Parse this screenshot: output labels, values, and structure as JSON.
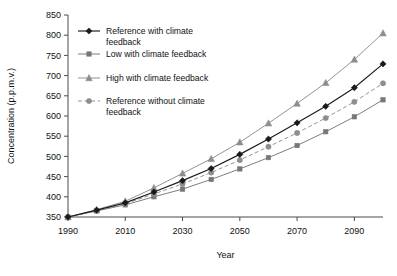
{
  "chart_data": {
    "type": "line",
    "title": "",
    "xlabel": "Year",
    "ylabel": "Concentration (p.p.m.v.)",
    "xlim": [
      1990,
      2100
    ],
    "ylim": [
      350,
      850
    ],
    "ytick_step": 50,
    "xtick_step": 20,
    "grid": false,
    "legend_position": "top-left",
    "xticks": [
      "1990",
      "2010",
      "2030",
      "2050",
      "2070",
      "2090"
    ],
    "xtick_values": [
      1990,
      2010,
      2030,
      2050,
      2070,
      2090
    ],
    "yticks": [
      "350",
      "400",
      "450",
      "500",
      "550",
      "600",
      "650",
      "700",
      "750",
      "800",
      "850"
    ],
    "ytick_values": [
      350,
      400,
      450,
      500,
      550,
      600,
      650,
      700,
      750,
      800,
      850
    ],
    "x": [
      1990,
      2000,
      2010,
      2020,
      2030,
      2040,
      2050,
      2060,
      2070,
      2080,
      2090,
      2100
    ],
    "series": [
      {
        "name": "Reference with climate feedback",
        "marker": "diamond",
        "color": "#1a1a1a",
        "linestyle": "solid",
        "values": [
          350,
          367,
          385,
          412,
          440,
          470,
          505,
          543,
          583,
          624,
          670,
          729
        ]
      },
      {
        "name": "Low with climate feedback",
        "marker": "square",
        "color": "#777777",
        "linestyle": "solid",
        "values": [
          350,
          365,
          380,
          400,
          419,
          443,
          469,
          497,
          527,
          561,
          598,
          640
        ]
      },
      {
        "name": "High with climate feedback",
        "marker": "triangle",
        "color": "#8d8d8d",
        "linestyle": "solid",
        "values": [
          350,
          368,
          389,
          422,
          458,
          494,
          535,
          582,
          631,
          682,
          740,
          805
        ]
      },
      {
        "name": "Reference without climate feedback",
        "marker": "circle",
        "color": "#8d8d8d",
        "linestyle": "dashed",
        "values": [
          350,
          366,
          383,
          407,
          432,
          460,
          491,
          524,
          558,
          595,
          635,
          681
        ]
      }
    ]
  },
  "legend": {
    "items": [
      {
        "label_line1": "Reference with climate",
        "label_line2": "feedback"
      },
      {
        "label_line1": "Low with climate feedback",
        "label_line2": ""
      },
      {
        "label_line1": "High with climate feedback",
        "label_line2": ""
      },
      {
        "label_line1": "Reference without climate",
        "label_line2": "feedback"
      }
    ]
  },
  "colors": {
    "axis": "#4a4a4a",
    "text": "#111111",
    "series_dark": "#1a1a1a",
    "series_gray": "#8d8d8d",
    "series_midgray": "#777777",
    "background": "#ffffff"
  }
}
